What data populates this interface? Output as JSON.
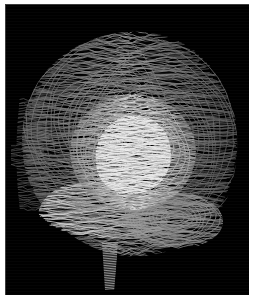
{
  "figure": {
    "title": "Sagittal brain contour-stack rendering",
    "caption": "",
    "modality_label": "MRI",
    "view_label": "sagittal",
    "orientation_note": "anterior left, posterior right"
  },
  "canvas": {
    "width": 258,
    "height": 303,
    "plate_left": 5,
    "plate_top": 4,
    "plate_width": 244,
    "plate_height": 291,
    "page_background": "#ffffff",
    "plate_background": "#000000"
  },
  "palette": {
    "background": "#000000",
    "page": "#ffffff",
    "contour_dim": "#5a5a5a",
    "contour_mid": "#9a9a9a",
    "contour_bright": "#d2d2d2",
    "contour_highlight": "#ececec",
    "plate_edge": "#6e6e6e"
  },
  "render": {
    "style": "stacked-contour-wireframe",
    "line_count": 150,
    "line_weight": 0.85,
    "slice_spacing_px": 1.65,
    "noise_opacity": 0.3
  },
  "structures": [
    {
      "name": "cerebrum-outer-cortex",
      "label": "Cerebral cortex (outer surface)",
      "brightness": "mid",
      "region": "whole-vault"
    },
    {
      "name": "central-deep-nuclei",
      "label": "Deep central nuclei / thalamic block",
      "brightness": "bright",
      "cx": 128,
      "cy": 148,
      "rx": 62,
      "ry": 58
    },
    {
      "name": "corpus-callosum-arc",
      "label": "Corpus callosum arc",
      "brightness": "highlight",
      "cx": 122,
      "cy": 150,
      "rx": 40,
      "ry": 38
    },
    {
      "name": "temporal-lobe-band",
      "label": "Temporal lobe band",
      "brightness": "bright",
      "cx": 98,
      "cy": 208,
      "rx": 66,
      "ry": 32
    },
    {
      "name": "cerebellum",
      "label": "Cerebellum",
      "brightness": "mid",
      "cx": 178,
      "cy": 212,
      "rx": 52,
      "ry": 36
    },
    {
      "name": "brainstem-column",
      "label": "Brainstem / upper cord",
      "brightness": "mid",
      "x": 96,
      "y_top": 240,
      "y_bottom": 284,
      "width": 15
    },
    {
      "name": "facial-profile-edge",
      "label": "Anterior facial profile edge",
      "brightness": "dim",
      "side": "left"
    }
  ]
}
